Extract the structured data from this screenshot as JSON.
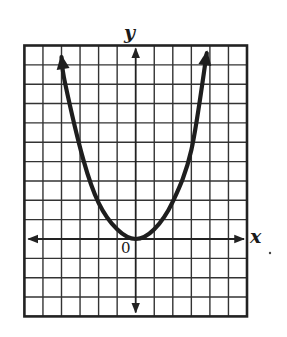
{
  "chart_data": {
    "type": "line",
    "title": "",
    "xlabel": "x",
    "ylabel": "y",
    "origin_label": "0",
    "xlim": [
      -6,
      6
    ],
    "ylim": [
      -4,
      10
    ],
    "grid": true,
    "grid_step": 1,
    "legend": null,
    "series": [
      {
        "name": "parabola",
        "description": "upward-opening parabola with vertex at the origin, arrows at both ends",
        "approx_equation": "y ≈ 0.55x^2",
        "x": [
          -4.0,
          -3.81,
          -2.82,
          -2.0,
          -1.0,
          0.0,
          1.0,
          2.0,
          3.0,
          3.83
        ],
        "y": [
          9.4,
          8.07,
          4.09,
          1.87,
          0.5,
          0.0,
          0.5,
          1.93,
          4.6,
          9.6
        ],
        "arrows": [
          "start",
          "end"
        ],
        "color": "#1e1e1e"
      }
    ],
    "annotations": [
      {
        "text": ".",
        "note": "stray dot to the right of x-axis label"
      }
    ]
  },
  "labels": {
    "x_axis": "x",
    "y_axis": "y",
    "origin": "0"
  },
  "colors": {
    "grid": "#333333",
    "border": "#222222",
    "curve": "#1e1e1e",
    "background": "#ffffff"
  }
}
